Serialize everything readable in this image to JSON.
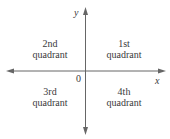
{
  "diagram": {
    "axes": {
      "x_label": "x",
      "y_label": "y",
      "origin_label": "0",
      "color": "#666666"
    },
    "quadrants": [
      {
        "id": "q2",
        "line1": "2nd",
        "line2": "quadrant"
      },
      {
        "id": "q1",
        "line1": "1st",
        "line2": "quadrant"
      },
      {
        "id": "q3",
        "line1": "3rd",
        "line2": "quadrant"
      },
      {
        "id": "q4",
        "line1": "4th",
        "line2": "quadrant"
      }
    ],
    "text_color": "#3a3a3a"
  }
}
